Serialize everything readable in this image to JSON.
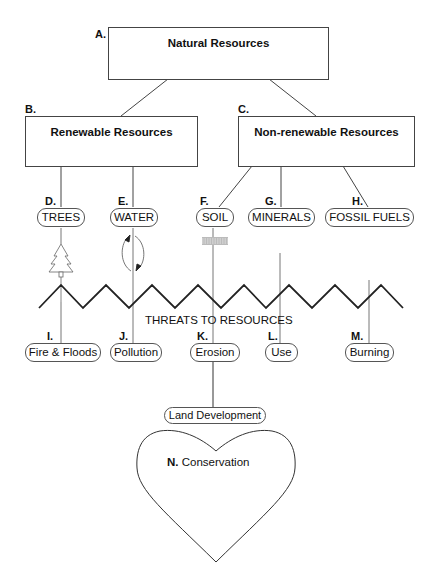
{
  "diagram": {
    "root": {
      "letter": "A.",
      "label": "Natural Resources"
    },
    "categories": [
      {
        "letter": "B.",
        "label": "Renewable Resources"
      },
      {
        "letter": "C.",
        "label": "Non-renewable Resources"
      }
    ],
    "resources": [
      {
        "letter": "D.",
        "label": "TREES",
        "category": "Renewable Resources",
        "icon": "tree-icon"
      },
      {
        "letter": "E.",
        "label": "WATER",
        "category": "Renewable Resources",
        "icon": "water-cycle-icon"
      },
      {
        "letter": "F.",
        "label": "SOIL",
        "category": "Non-renewable Resources",
        "icon": "soil-texture-icon"
      },
      {
        "letter": "G.",
        "label": "MINERALS",
        "category": "Non-renewable Resources"
      },
      {
        "letter": "H.",
        "label": "FOSSIL FUELS",
        "category": "Non-renewable Resources"
      }
    ],
    "threats_caption": "THREATS TO RESOURCES",
    "threats": [
      {
        "letter": "I.",
        "label": "Fire & Floods"
      },
      {
        "letter": "J.",
        "label": "Pollution"
      },
      {
        "letter": "K.",
        "label": "Erosion"
      },
      {
        "letter": "L.",
        "label": "Use"
      },
      {
        "letter": "M.",
        "label": "Burning"
      }
    ],
    "extra_threat": {
      "label": "Land Development"
    },
    "conservation": {
      "letter": "N.",
      "label": "Conservation"
    }
  }
}
